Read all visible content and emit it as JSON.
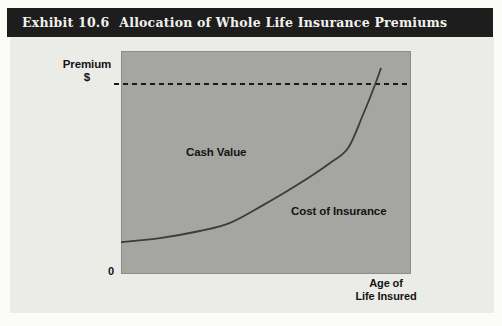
{
  "exhibit": {
    "label": "Exhibit 10.6",
    "title": "Allocation of Whole Life Insurance Premiums"
  },
  "figure": {
    "y_axis_label_line1": "Premium",
    "y_axis_label_line2": "$",
    "origin_label": "0",
    "x_axis_label_line1": "Age of",
    "x_axis_label_line2": "Life Insured",
    "area_label": "Cash Value",
    "curve_label": "Cost of Insurance"
  },
  "colors": {
    "page_bg": "#fbfbf8",
    "title_bar_bg": "#1d1d1d",
    "title_text": "#f2f1ec",
    "panel_bg": "#ebebe7",
    "plot_area_bg": "#a5a5a1",
    "plot_border": "#8b8b87",
    "dashed_line": "#1a1a1a",
    "curve": "#3c3c3c",
    "label_text": "#141414"
  },
  "chart_data": {
    "type": "line",
    "title": "Allocation of Whole Life Insurance Premiums",
    "xlabel": "Age of Life Insured",
    "ylabel": "Premium $",
    "x_origin_tick": "0",
    "axes_numeric": false,
    "grid": false,
    "legend": "none (labels annotated inside plot)",
    "series": [
      {
        "name": "Level Premium",
        "style": "dashed",
        "smooth": false,
        "stroke_width": 2,
        "dash": "5 4",
        "color_key": "dashed_line",
        "points_norm": [
          [
            -0.024,
            0.852
          ],
          [
            1.0,
            0.852
          ]
        ]
      },
      {
        "name": "Cost of Insurance",
        "style": "solid",
        "smooth": true,
        "stroke_width": 1.8,
        "dash": "",
        "color_key": "curve",
        "points_norm": [
          [
            0.0,
            0.143
          ],
          [
            0.134,
            0.161
          ],
          [
            0.272,
            0.193
          ],
          [
            0.376,
            0.229
          ],
          [
            0.49,
            0.309
          ],
          [
            0.607,
            0.399
          ],
          [
            0.721,
            0.498
          ],
          [
            0.783,
            0.565
          ],
          [
            0.834,
            0.713
          ],
          [
            0.869,
            0.825
          ],
          [
            0.897,
            0.924
          ]
        ]
      }
    ],
    "annotations": [
      {
        "text": "Cash Value",
        "region": "area between cost-of-insurance curve and level premium dashed line"
      },
      {
        "text": "Cost of Insurance",
        "region": "below curve, lower right of plot"
      }
    ]
  }
}
